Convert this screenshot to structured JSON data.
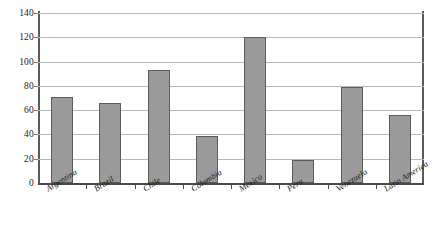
{
  "chart_data": {
    "type": "bar",
    "title": "",
    "subtitle": "",
    "xlabel": "",
    "ylabel": "",
    "categories": [
      "Argentina",
      "Brazil",
      "Chile",
      "Colombia",
      "Mexico",
      "Peru",
      "Venezuela",
      "Latin America"
    ],
    "values": [
      71,
      66,
      93,
      39,
      120,
      19,
      79,
      56
    ],
    "series": [
      {
        "name": "",
        "values": [
          71,
          66,
          93,
          39,
          120,
          19,
          79,
          56
        ]
      }
    ],
    "ylim": [
      0,
      140
    ],
    "ytick_labels": [
      "0",
      "20",
      "40",
      "60",
      "80",
      "100",
      "120",
      "140"
    ],
    "ytick_values": [
      0,
      20,
      40,
      60,
      80,
      100,
      120,
      140
    ],
    "grid": true,
    "legend": false,
    "legend_position": "none",
    "colors": {
      "bar_fill": "#9a9a9a",
      "bar_border": "#5c5c5c",
      "gridline": "#b9b9b9",
      "axis": "#4a4a4a",
      "background": "#ffffff",
      "text": "#1a1a1a"
    }
  }
}
